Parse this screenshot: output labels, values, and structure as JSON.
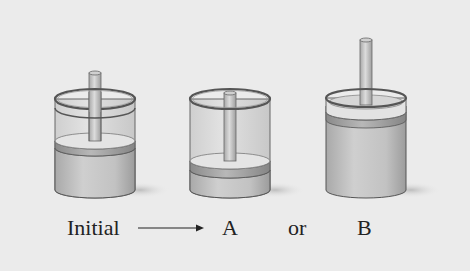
{
  "figure": {
    "cylinders": [
      {
        "id": "initial",
        "name": "initial-cylinder",
        "piston_level": "middle"
      },
      {
        "id": "A",
        "name": "cylinder-a",
        "piston_level": "low"
      },
      {
        "id": "B",
        "name": "cylinder-b",
        "piston_level": "top"
      }
    ],
    "labels": {
      "initial": "Initial",
      "a": "A",
      "or": "or",
      "b": "B"
    },
    "arrow": "right-arrow-icon",
    "colors": {
      "background": "#ebebeb",
      "cylinder_glass": "#d9d9d9",
      "gas": "#bdbdbd",
      "piston_top": "#e6e6e6",
      "piston_band": "#9a9a9a",
      "rod": "#c4c4c4",
      "outline": "#555555"
    }
  }
}
